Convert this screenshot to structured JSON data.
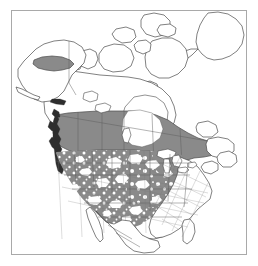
{
  "figure": {
    "kind": "species-distribution-map",
    "region_title": "North America",
    "frame_color": "#a9a9a9",
    "background_color": "#ffffff"
  },
  "legend": {
    "shaded_fill": "#8a8a8a",
    "unshaded_fill": "#ffffff",
    "outline_color": "#4a4a4a",
    "coast_detail_color": "#2e2e2e"
  },
  "map": {
    "projection_hint": "lambert-conformal-conic",
    "landmasses": [
      "Alaska",
      "Canada",
      "Greenland",
      "Contiguous United States",
      "Mexico"
    ],
    "shaded_regions": [
      "Interior Alaska",
      "British Columbia",
      "Alberta",
      "Saskatchewan",
      "Manitoba",
      "Ontario",
      "Quebec",
      "Pacific Northwest United States",
      "Mountain West United States",
      "Great Plains United States",
      "Upper Midwest United States",
      "Texas"
    ],
    "unshaded_regions": [
      "Canadian Arctic Archipelago",
      "Yukon",
      "Northwest Territories",
      "Nunavut",
      "Greenland",
      "Hudson Bay",
      "Atlantic Canada",
      "Eastern United States",
      "Southeastern United States",
      "Florida",
      "Mexico"
    ],
    "water_bodies": [
      "Hudson Bay",
      "Great Lakes",
      "Great Slave Lake",
      "Great Bear Lake",
      "Lake Winnipeg"
    ]
  }
}
